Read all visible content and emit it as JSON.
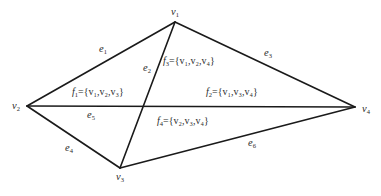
{
  "diagram": {
    "type": "planar-graph",
    "vertices": [
      {
        "id": "v1",
        "name": "v",
        "sub": "1",
        "x": 175,
        "y": 22
      },
      {
        "id": "v2",
        "name": "v",
        "sub": "2",
        "x": 27,
        "y": 106
      },
      {
        "id": "v3",
        "name": "v",
        "sub": "3",
        "x": 120,
        "y": 168
      },
      {
        "id": "v4",
        "name": "v",
        "sub": "4",
        "x": 355,
        "y": 107
      }
    ],
    "edges": [
      {
        "id": "e1",
        "name": "e",
        "sub": "1",
        "from": "v1",
        "to": "v2"
      },
      {
        "id": "e2",
        "name": "e",
        "sub": "2",
        "from": "v1",
        "to": "v3"
      },
      {
        "id": "e3",
        "name": "e",
        "sub": "3",
        "from": "v1",
        "to": "v4"
      },
      {
        "id": "e4",
        "name": "e",
        "sub": "4",
        "from": "v2",
        "to": "v3"
      },
      {
        "id": "e5",
        "name": "e",
        "sub": "5",
        "from": "v2",
        "to": "v4"
      },
      {
        "id": "e6",
        "name": "e",
        "sub": "6",
        "from": "v3",
        "to": "v4"
      }
    ],
    "faces": [
      {
        "id": "f1",
        "name": "f",
        "sub": "1",
        "prefix": "={",
        "items": [
          [
            "v",
            "1"
          ],
          [
            "v",
            "2"
          ],
          [
            "v",
            "3"
          ]
        ]
      },
      {
        "id": "f2",
        "name": "f",
        "sub": "2",
        "prefix": "={",
        "items": [
          [
            "v",
            "1"
          ],
          [
            "v",
            "3"
          ],
          [
            "v",
            "4"
          ]
        ]
      },
      {
        "id": "f3",
        "name": "f",
        "sub": "3",
        "prefix": "={",
        "items": [
          [
            "v",
            "1"
          ],
          [
            "v",
            "2"
          ],
          [
            "v",
            "4"
          ]
        ]
      },
      {
        "id": "f4",
        "name": "f",
        "sub": "4",
        "prefix": "={",
        "items": [
          [
            "v",
            "2"
          ],
          [
            "v",
            "3"
          ],
          [
            "v",
            "4"
          ]
        ]
      }
    ],
    "text": {
      "v1": "v",
      "v1_sub": "1",
      "v2": "v",
      "v2_sub": "2",
      "v3": "v",
      "v3_sub": "3",
      "v4": "v",
      "v4_sub": "4",
      "e1": "e",
      "e1_sub": "1",
      "e2": "e",
      "e2_sub": "2",
      "e3": "e",
      "e3_sub": "3",
      "e4": "e",
      "e4_sub": "4",
      "e5": "e",
      "e5_sub": "5",
      "e6": "e",
      "e6_sub": "6",
      "f1": "f",
      "f1_sub": "1",
      "f1_set": "={v₁,v₂,v₃}",
      "f2": "f",
      "f2_sub": "2",
      "f2_set": "={v₁,v₃,v₄}",
      "f3": "f",
      "f3_sub": "3",
      "f3_set": "={v₁,v₂,v₄}",
      "f4": "f",
      "f4_sub": "4",
      "f4_set": "={v₂,v₃,v₄}"
    },
    "colors": {
      "line": "#1a1a1a",
      "text": "#2a2a2a",
      "background": "#ffffff"
    }
  }
}
